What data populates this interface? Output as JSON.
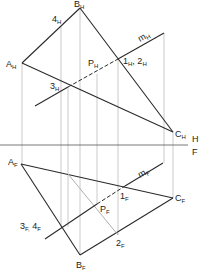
{
  "diagram": {
    "title": "",
    "type": "descriptive-geometry-projection",
    "views": [
      "H",
      "F"
    ],
    "folding_line": {
      "label_top": "H",
      "label_bottom": "F",
      "y": 145
    },
    "colors": {
      "object_line": "#2a2a2a",
      "projector_line": "#b8b8b8",
      "construction_line": "#b0b0b0",
      "label": "#222222",
      "background": "#ffffff"
    },
    "top_view": {
      "points": [
        {
          "id": "A_H",
          "base": "A",
          "sub": "H",
          "x": 22,
          "y": 63
        },
        {
          "id": "B_H",
          "base": "B",
          "sub": "H",
          "x": 80,
          "y": 8
        },
        {
          "id": "C_H",
          "base": "C",
          "sub": "H",
          "x": 173,
          "y": 132
        },
        {
          "id": "4_H",
          "base": "4",
          "sub": "H",
          "x": 61,
          "y": 27
        },
        {
          "id": "3_H",
          "base": "3",
          "sub": "H",
          "x": 68,
          "y": 87
        },
        {
          "id": "P_H",
          "base": "P",
          "sub": "H",
          "x": 97,
          "y": 74
        },
        {
          "id": "1_H_2_H",
          "base": "1",
          "sub": "H",
          "x": 118,
          "y": 59
        }
      ],
      "labels": [
        {
          "key": "A",
          "sub": "H",
          "x": 6,
          "y": 68
        },
        {
          "key": "B",
          "sub": "H",
          "x": 76,
          "y": 5
        },
        {
          "key": "C",
          "sub": "H",
          "x": 175,
          "y": 138
        },
        {
          "key": "4",
          "sub": "H",
          "x": 52,
          "y": 22
        },
        {
          "key": "3",
          "sub": "H",
          "x": 51,
          "y": 90
        },
        {
          "key": "P",
          "sub": "H",
          "x": 87,
          "y": 66
        },
        {
          "key": "1",
          "sub": "H",
          "x": 123,
          "y": 64,
          "extra": ",  2",
          "extra_sub": "H"
        },
        {
          "key": "m",
          "sub": "H",
          "x": 143,
          "y": 40,
          "rotate": -30
        }
      ],
      "line_m": {
        "label": "m",
        "sub": "H"
      }
    },
    "front_view": {
      "points": [
        {
          "id": "A_F",
          "base": "A",
          "sub": "F",
          "x": 21,
          "y": 164
        },
        {
          "id": "B_F",
          "base": "B",
          "sub": "F",
          "x": 80,
          "y": 255
        },
        {
          "id": "C_F",
          "base": "C",
          "sub": "F",
          "x": 173,
          "y": 198
        },
        {
          "id": "1_F",
          "base": "1",
          "sub": "F",
          "x": 125,
          "y": 186
        },
        {
          "id": "2_F",
          "base": "2",
          "sub": "F",
          "x": 118,
          "y": 235
        },
        {
          "id": "P_F",
          "base": "P",
          "sub": "F",
          "x": 97,
          "y": 204
        },
        {
          "id": "3_F_4_F",
          "base": "3",
          "sub": "F",
          "x": 60,
          "y": 227
        }
      ],
      "labels": [
        {
          "key": "A",
          "sub": "F",
          "x": 8,
          "y": 165
        },
        {
          "key": "B",
          "sub": "F",
          "x": 77,
          "y": 270
        },
        {
          "key": "C",
          "sub": "F",
          "x": 175,
          "y": 201
        },
        {
          "key": "1",
          "sub": "F",
          "x": 121,
          "y": 200
        },
        {
          "key": "2",
          "sub": "F",
          "x": 116,
          "y": 247
        },
        {
          "key": "P",
          "sub": "F",
          "x": 100,
          "y": 213
        },
        {
          "key": "3",
          "sub": "F,",
          "x": 20,
          "y": 230,
          "extra": " 4",
          "extra_sub": "F"
        },
        {
          "key": "m",
          "sub": "F",
          "x": 140,
          "y": 176,
          "rotate": -30
        }
      ],
      "line_m": {
        "label": "m",
        "sub": "F"
      }
    }
  }
}
